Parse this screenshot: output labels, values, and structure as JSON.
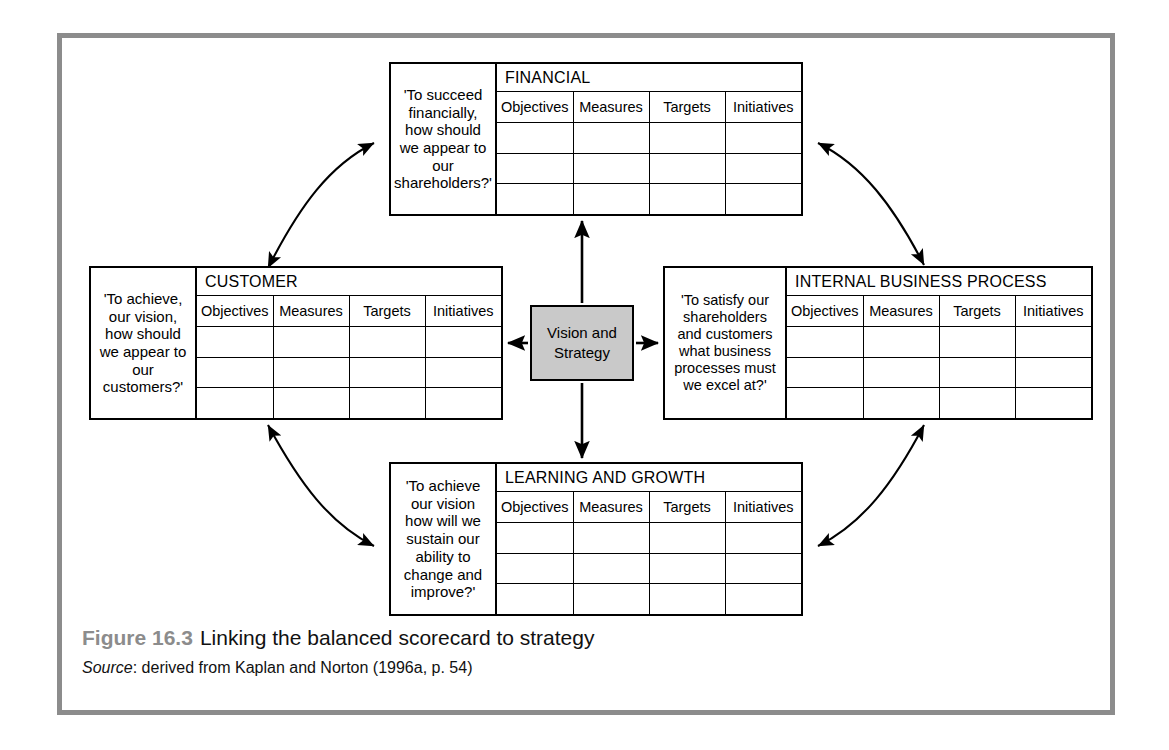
{
  "figure": {
    "caption_number": "Figure 16.3",
    "caption_title": "Linking the balanced scorecard to strategy",
    "source_label": "Source",
    "source_text": ": derived from Kaplan and Norton (1996a, p. 54)"
  },
  "center": {
    "label_line1": "Vision and",
    "label_line2": "Strategy",
    "fill_color": "#c9c9c9",
    "border_color": "#000000"
  },
  "columns": [
    "Objectives",
    "Measures",
    "Targets",
    "Initiatives"
  ],
  "empty_row_count": 3,
  "perspectives": {
    "financial": {
      "title": "FINANCIAL",
      "question": "'To succeed financially, how should we appear to our shareholders?'",
      "columns": [
        "Objectives",
        "Measures",
        "Targets",
        "Initiatives"
      ]
    },
    "customer": {
      "title": "CUSTOMER",
      "question": "'To achieve, our vision, how should we appear to our customers?'",
      "columns": [
        "Objectives",
        "Measures",
        "Targets",
        "Initiatives"
      ]
    },
    "internal": {
      "title": "INTERNAL BUSINESS PROCESS",
      "question": "'To satisfy our shareholders and customers what business processes must we excel at?'",
      "columns": [
        "Objectives",
        "Measures",
        "Targets",
        "Initiatives"
      ]
    },
    "learning": {
      "title": "LEARNING AND GROWTH",
      "question": "'To achieve our vision how will we sustain our ability to change and improve?'",
      "columns": [
        "Objectives",
        "Measures",
        "Targets",
        "Initiatives"
      ]
    }
  },
  "frame": {
    "border_color": "#8c8c8c"
  },
  "connectors": {
    "center_arrows": [
      {
        "name": "center-to-financial",
        "direction": "up"
      },
      {
        "name": "center-to-customer",
        "direction": "left"
      },
      {
        "name": "center-to-internal",
        "direction": "right"
      },
      {
        "name": "center-to-learning",
        "direction": "down"
      }
    ],
    "cycle_arcs": [
      {
        "name": "arc-customer-financial",
        "style": "double-headed-curve"
      },
      {
        "name": "arc-financial-internal",
        "style": "double-headed-curve"
      },
      {
        "name": "arc-internal-learning",
        "style": "double-headed-curve"
      },
      {
        "name": "arc-learning-customer",
        "style": "double-headed-curve"
      }
    ]
  }
}
